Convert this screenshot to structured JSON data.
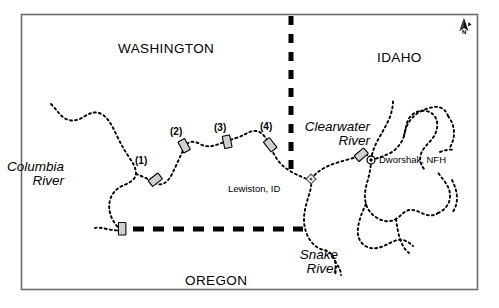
{
  "figure": {
    "type": "map",
    "frame": {
      "border_color": "#6b6b6b",
      "background": "#ffffff"
    }
  },
  "states": [
    {
      "id": "washington",
      "label": "WASHINGTON",
      "x": 118,
      "y": 48
    },
    {
      "id": "idaho",
      "label": "IDAHO",
      "x": 377,
      "y": 57
    },
    {
      "id": "oregon",
      "label": "OREGON",
      "x": 185,
      "y": 280
    }
  ],
  "rivers": [
    {
      "id": "columbia",
      "label": "Columbia\nRiver",
      "line1": "Columbia",
      "line2": "River",
      "x": 44,
      "y": 165,
      "align": "right",
      "style": "italic"
    },
    {
      "id": "clearwater",
      "label": "Clearwater\nRiver",
      "line1": "Clearwater",
      "line2": "River",
      "x": 300,
      "y": 125,
      "align": "right",
      "style": "italic"
    },
    {
      "id": "snake",
      "label": "Snake\nRiver",
      "line1": "Snake",
      "line2": "River",
      "x": 288,
      "y": 253,
      "align": "right",
      "style": "italic"
    }
  ],
  "dams": [
    {
      "id": "dam-1",
      "label": "(1)",
      "label_x": 111,
      "label_y": 155,
      "x": 155,
      "y": 183,
      "rotation": -38
    },
    {
      "id": "dam-2",
      "label": "(2)",
      "label_x": 170,
      "label_y": 127,
      "x": 184,
      "y": 146,
      "rotation": -28
    },
    {
      "id": "dam-3",
      "label": "(3)",
      "label_x": 214,
      "label_y": 123,
      "x": 227,
      "y": 142,
      "rotation": -12
    },
    {
      "id": "dam-4",
      "label": "(4)",
      "label_x": 262,
      "label_y": 122,
      "x": 270,
      "y": 145,
      "rotation": -38
    },
    {
      "id": "dam-unnamed-columbia",
      "label": "",
      "label_x": 0,
      "label_y": 0,
      "x": 122,
      "y": 229,
      "rotation": 0
    },
    {
      "id": "dam-dworshak",
      "label": "",
      "label_x": 0,
      "label_y": 0,
      "x": 361,
      "y": 154,
      "rotation": -40
    }
  ],
  "places": [
    {
      "id": "lewiston",
      "label": "Lewiston, ID",
      "marker": "diamond-dot",
      "marker_x": 311,
      "marker_y": 179,
      "label_x": 228,
      "label_y": 188,
      "label_align": "left"
    },
    {
      "id": "dworshak",
      "label": "Dworshak, NFH",
      "marker": "circle-dot",
      "marker_x": 371,
      "marker_y": 160,
      "label_x": 379,
      "label_y": 155,
      "label_align": "left"
    }
  ],
  "compass": {
    "id": "north-arrow",
    "label": "N",
    "x": 464,
    "y": 28
  },
  "borders": [
    {
      "id": "wa-id-border",
      "orientation": "vertical",
      "style": "thick-dashed"
    },
    {
      "id": "wa-or-border",
      "orientation": "horizontal",
      "style": "thick-dashed"
    }
  ],
  "colors": {
    "frame": "#6b6b6b",
    "river": "#000000",
    "border_line": "#000000",
    "dam_fill": "#cfcfcf",
    "dam_stroke": "#000000",
    "text": "#000000"
  }
}
